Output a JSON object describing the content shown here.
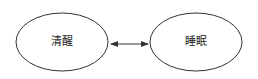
{
  "diagram": {
    "nodes": [
      {
        "id": "awake",
        "label": "清醒",
        "shape": "ellipse",
        "cx": 62,
        "cy": 42,
        "rx": 46,
        "ry": 29
      },
      {
        "id": "sleep",
        "label": "睡眠",
        "shape": "ellipse",
        "cx": 196,
        "cy": 42,
        "rx": 46,
        "ry": 29
      }
    ],
    "edges": [
      {
        "from": "awake",
        "to": "sleep",
        "direction": "bidirectional"
      }
    ],
    "colors": {
      "stroke": "#333333",
      "fill": "#ffffff",
      "text": "#222222",
      "background": "#ffffff"
    }
  }
}
